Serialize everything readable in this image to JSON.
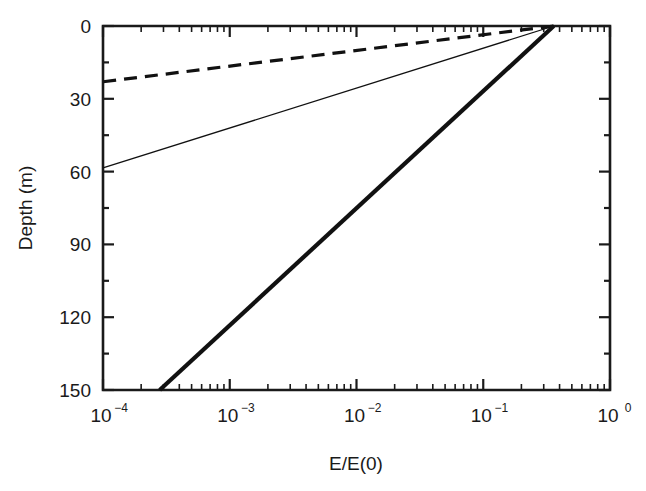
{
  "chart_data": {
    "type": "line",
    "title": "",
    "subtitle": "",
    "xlabel": "E/E(0)",
    "ylabel": "Depth (m)",
    "xscale": "log",
    "yscale": "linear",
    "xlim": [
      0.0001,
      1
    ],
    "ylim": [
      150,
      0
    ],
    "y_inverted": true,
    "grid": false,
    "legend": "none",
    "xticks": [
      0.0001,
      0.001,
      0.01,
      0.1,
      1
    ],
    "xtick_labels": [
      "10−4",
      "10−3",
      "10−2",
      "10−1",
      "10⁰"
    ],
    "xtick_mantissas": [
      "10",
      "10",
      "10",
      "10",
      "10"
    ],
    "xtick_exponents": [
      "-4",
      "-3",
      "-2",
      "-1",
      "0"
    ],
    "yticks": [
      0,
      30,
      60,
      90,
      120,
      150
    ],
    "ytick_labels": [
      "0",
      "30",
      "60",
      "90",
      "120",
      "150"
    ],
    "minor_ticks": true,
    "series": [
      {
        "name": "dashed-attenuation-profile",
        "style": "dashed",
        "linewidth": 3.2,
        "color": "#111111",
        "surface_value": 0.36,
        "points": [
          {
            "x": 0.36,
            "y": 0
          },
          {
            "x": 0.0001,
            "y": 23
          }
        ]
      },
      {
        "name": "thin-attenuation-profile",
        "style": "solid",
        "linewidth": 1.3,
        "color": "#111111",
        "surface_value": 0.36,
        "points": [
          {
            "x": 0.36,
            "y": 0
          },
          {
            "x": 0.0001,
            "y": 58.5
          }
        ]
      },
      {
        "name": "thick-attenuation-profile",
        "style": "solid",
        "linewidth": 4.2,
        "color": "#111111",
        "surface_value": 0.36,
        "points": [
          {
            "x": 0.36,
            "y": 0
          },
          {
            "x": 0.00028,
            "y": 150
          }
        ]
      }
    ]
  },
  "figure": {
    "background_color": "#ffffff",
    "axis_color": "#1a1a1a",
    "text_color": "#1a1a1a"
  }
}
